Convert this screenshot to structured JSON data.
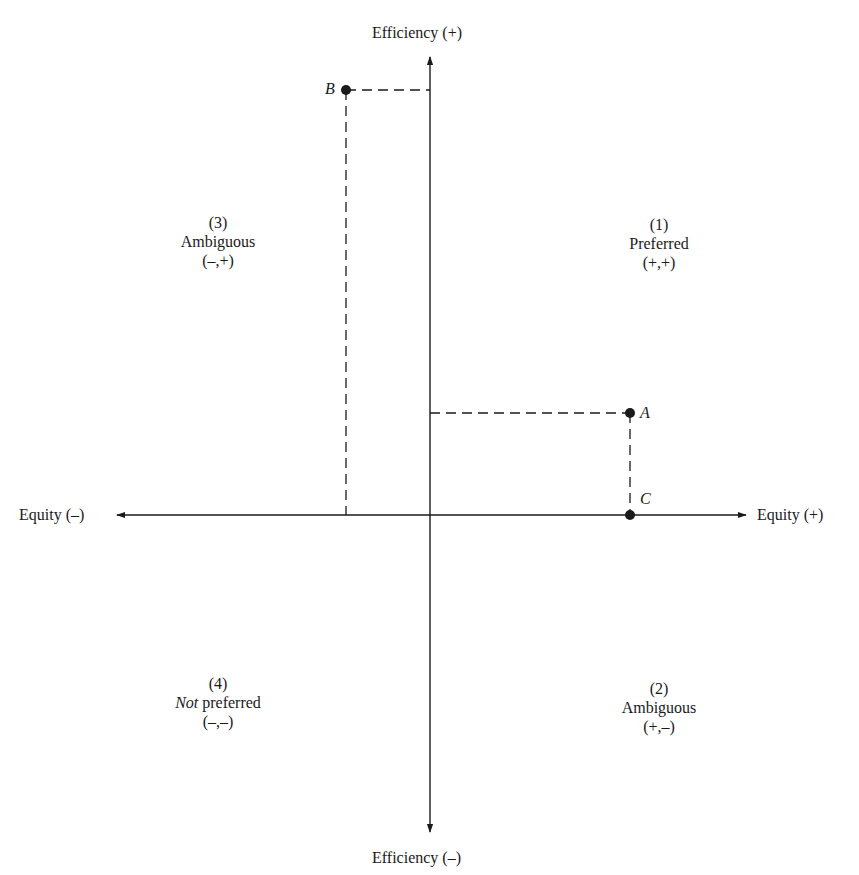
{
  "axes": {
    "y_top_label": "Efficiency (+)",
    "y_bottom_label": "Efficiency (–)",
    "x_left_label": "Equity (–)",
    "x_right_label": "Equity (+)"
  },
  "quadrants": {
    "q1": {
      "number": "(1)",
      "name": "Preferred",
      "signs": "(+,+)"
    },
    "q2": {
      "number": "(2)",
      "name": "Ambiguous",
      "signs": "(+,–)"
    },
    "q3": {
      "number": "(3)",
      "name": "Ambiguous",
      "signs": "(–,+)"
    },
    "q4": {
      "number": "(4)",
      "name_italic": "Not",
      "name_rest": " preferred",
      "signs": "(–,–)"
    }
  },
  "points": {
    "A": {
      "label": "A"
    },
    "B": {
      "label": "B"
    },
    "C": {
      "label": "C"
    }
  },
  "colors": {
    "ink": "#1a1a1a",
    "background": "#ffffff"
  }
}
